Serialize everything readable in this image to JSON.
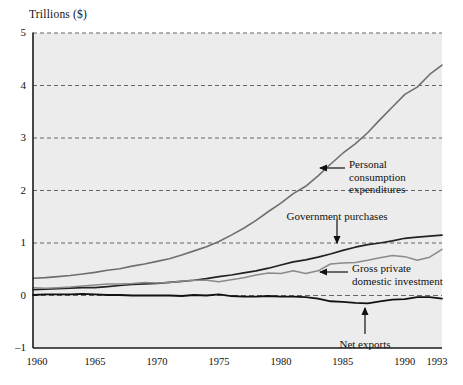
{
  "chart_data": {
    "type": "line",
    "title": "",
    "ylabel": "Trillions ($)",
    "xlabel": "",
    "ylim": [
      -1,
      5
    ],
    "xlim": [
      1960,
      1993
    ],
    "grid": true,
    "gridlines_y": [
      5,
      4,
      3,
      2,
      1,
      0
    ],
    "legend_position": "inline-annotations",
    "yticks": [
      "5",
      "4",
      "3",
      "2",
      "1",
      "0",
      "–1"
    ],
    "ytick_values": [
      5,
      4,
      3,
      2,
      1,
      0,
      -1
    ],
    "xticks": [
      "1960",
      "1965",
      "1970",
      "1975",
      "1980",
      "1985",
      "1990",
      "1993"
    ],
    "xtick_values": [
      1960,
      1965,
      1970,
      1975,
      1980,
      1985,
      1990,
      1993
    ],
    "x": [
      1960,
      1961,
      1962,
      1963,
      1964,
      1965,
      1966,
      1967,
      1968,
      1969,
      1970,
      1971,
      1972,
      1973,
      1974,
      1975,
      1976,
      1977,
      1978,
      1979,
      1980,
      1981,
      1982,
      1983,
      1984,
      1985,
      1986,
      1987,
      1988,
      1989,
      1990,
      1991,
      1992,
      1993
    ],
    "series": [
      {
        "name": "Personal consumption expenditures",
        "color": "#6f6f6f",
        "width": 1.6,
        "values": [
          0.33,
          0.34,
          0.36,
          0.38,
          0.41,
          0.44,
          0.48,
          0.51,
          0.56,
          0.6,
          0.65,
          0.7,
          0.77,
          0.85,
          0.93,
          1.03,
          1.15,
          1.28,
          1.43,
          1.6,
          1.76,
          1.94,
          2.08,
          2.28,
          2.5,
          2.71,
          2.89,
          3.1,
          3.35,
          3.59,
          3.83,
          3.97,
          4.21,
          4.39
        ]
      },
      {
        "name": "Government purchases",
        "color": "#222222",
        "width": 1.7,
        "values": [
          0.11,
          0.12,
          0.13,
          0.14,
          0.15,
          0.15,
          0.17,
          0.19,
          0.21,
          0.22,
          0.23,
          0.25,
          0.27,
          0.29,
          0.32,
          0.36,
          0.39,
          0.43,
          0.47,
          0.52,
          0.58,
          0.64,
          0.68,
          0.73,
          0.79,
          0.86,
          0.92,
          0.97,
          1.0,
          1.04,
          1.09,
          1.11,
          1.13,
          1.15
        ]
      },
      {
        "name": "Gross private domestic investment",
        "color": "#8a8a8a",
        "width": 1.5,
        "values": [
          0.15,
          0.14,
          0.15,
          0.16,
          0.18,
          0.2,
          0.22,
          0.22,
          0.23,
          0.25,
          0.24,
          0.25,
          0.27,
          0.29,
          0.29,
          0.26,
          0.3,
          0.34,
          0.39,
          0.43,
          0.42,
          0.47,
          0.42,
          0.47,
          0.6,
          0.62,
          0.63,
          0.67,
          0.72,
          0.76,
          0.74,
          0.67,
          0.73,
          0.88
        ]
      },
      {
        "name": "Net exports",
        "color": "#111111",
        "width": 1.8,
        "values": [
          0.01,
          0.02,
          0.02,
          0.02,
          0.03,
          0.02,
          0.01,
          0.01,
          0.0,
          0.0,
          0.0,
          0.0,
          -0.01,
          0.01,
          0.0,
          0.02,
          -0.01,
          -0.02,
          -0.02,
          -0.01,
          -0.02,
          -0.02,
          -0.03,
          -0.06,
          -0.11,
          -0.12,
          -0.14,
          -0.15,
          -0.11,
          -0.08,
          -0.07,
          -0.03,
          -0.03,
          -0.06
        ]
      }
    ],
    "annotations": [
      {
        "id": "personal-consumption",
        "lines": [
          "Personal",
          "consumption",
          "expenditures"
        ],
        "text_x": 349,
        "text_y": 158,
        "arrow": {
          "x1": 345,
          "y1": 168,
          "x2": 320,
          "y2": 168
        }
      },
      {
        "id": "government-purchases",
        "lines": [
          "Government purchases"
        ],
        "text_x": 337,
        "text_y": 210,
        "arrow": {
          "x1": 337,
          "y1": 220,
          "x2": 337,
          "y2": 243
        }
      },
      {
        "id": "gross-private-domestic-investment",
        "lines": [
          "Gross private",
          "domestic investment"
        ],
        "text_x": 352,
        "text_y": 262,
        "arrow": {
          "x1": 348,
          "y1": 272,
          "x2": 320,
          "y2": 272
        }
      },
      {
        "id": "net-exports",
        "lines": [
          "Net exports"
        ],
        "text_x": 365,
        "text_y": 338,
        "arrow": {
          "x1": 365,
          "y1": 334,
          "x2": 365,
          "y2": 308
        }
      }
    ]
  },
  "colors": {
    "plot_background": "#ececec",
    "axis": "#1a1a1a",
    "gridline": "#555555"
  }
}
